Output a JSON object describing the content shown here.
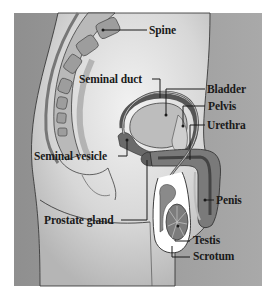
{
  "diagram": {
    "type": "anatomical-illustration",
    "labels": [
      {
        "id": "spine",
        "text": "Spine"
      },
      {
        "id": "seminal-duct",
        "text": "Seminal duct"
      },
      {
        "id": "bladder",
        "text": "Bladder"
      },
      {
        "id": "pelvis",
        "text": "Pelvis"
      },
      {
        "id": "urethra",
        "text": "Urethra"
      },
      {
        "id": "seminal-vesicle",
        "text": "Seminal vesicle"
      },
      {
        "id": "penis",
        "text": "Penis"
      },
      {
        "id": "prostate-gland",
        "text": "Prostate gland"
      },
      {
        "id": "testis",
        "text": "Testis"
      },
      {
        "id": "scrotum",
        "text": "Scrotum"
      }
    ],
    "colors": {
      "background": "#9a9a9a",
      "body": "#d9d9d9",
      "organ_dark": "#6e6e6e",
      "organ_mid": "#a8a8a8",
      "outline": "#2a2a2a",
      "label_text": "#1a1a1a"
    }
  }
}
